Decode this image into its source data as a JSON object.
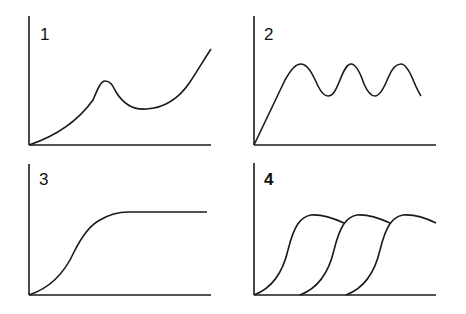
{
  "panels": [
    {
      "label": "1",
      "description": "Rising curve with a local peak, dip, then steep rise"
    },
    {
      "label": "2",
      "description": "Linear rise then sustained oscillation"
    },
    {
      "label": "3",
      "description": "Sigmoid rise to a plateau"
    },
    {
      "label": "4",
      "description": "Three staggered sigmoid curves overlapping"
    }
  ],
  "colors": {
    "line": "#1a1a1a",
    "background": "#ffffff"
  }
}
